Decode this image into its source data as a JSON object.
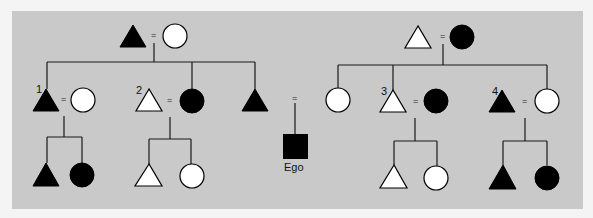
{
  "diagram": {
    "background_color": "#c9c9c9",
    "page_color": "#f4f4f4",
    "symbol_legend": {
      "triangle": "male",
      "circle": "female",
      "square": "ego",
      "equals": "marriage",
      "filled": "black",
      "hollow": "white"
    },
    "ego_label": "Ego",
    "equals_sign": "=",
    "numbers": [
      "1",
      "2",
      "3",
      "4"
    ],
    "generations": {
      "grandparents": [
        {
          "side": "left",
          "husband": {
            "shape": "triangle",
            "fill": "black"
          },
          "wife": {
            "shape": "circle",
            "fill": "white"
          }
        },
        {
          "side": "right",
          "husband": {
            "shape": "triangle",
            "fill": "white"
          },
          "wife": {
            "shape": "circle",
            "fill": "black"
          }
        }
      ],
      "parents": [
        {
          "label": "1",
          "husband": {
            "shape": "triangle",
            "fill": "black"
          },
          "wife": {
            "shape": "circle",
            "fill": "white"
          }
        },
        {
          "label": "2",
          "husband": {
            "shape": "triangle",
            "fill": "white"
          },
          "wife": {
            "shape": "circle",
            "fill": "black"
          }
        },
        {
          "label": "",
          "person": {
            "shape": "triangle",
            "fill": "black"
          }
        },
        {
          "label": "",
          "person": {
            "shape": "circle",
            "fill": "white"
          }
        },
        {
          "label": "3",
          "husband": {
            "shape": "triangle",
            "fill": "white"
          },
          "wife": {
            "shape": "circle",
            "fill": "black"
          }
        },
        {
          "label": "4",
          "husband": {
            "shape": "triangle",
            "fill": "black"
          },
          "wife": {
            "shape": "circle",
            "fill": "white"
          }
        }
      ],
      "children": [
        {
          "of": "1",
          "members": [
            {
              "shape": "triangle",
              "fill": "black"
            },
            {
              "shape": "circle",
              "fill": "black"
            }
          ]
        },
        {
          "of": "2",
          "members": [
            {
              "shape": "triangle",
              "fill": "white"
            },
            {
              "shape": "circle",
              "fill": "white"
            }
          ]
        },
        {
          "of": "ego-parents",
          "members": [
            {
              "shape": "square",
              "fill": "black",
              "label": "Ego"
            }
          ]
        },
        {
          "of": "3",
          "members": [
            {
              "shape": "triangle",
              "fill": "white"
            },
            {
              "shape": "circle",
              "fill": "white"
            }
          ]
        },
        {
          "of": "4",
          "members": [
            {
              "shape": "triangle",
              "fill": "black"
            },
            {
              "shape": "circle",
              "fill": "black"
            }
          ]
        }
      ]
    }
  }
}
